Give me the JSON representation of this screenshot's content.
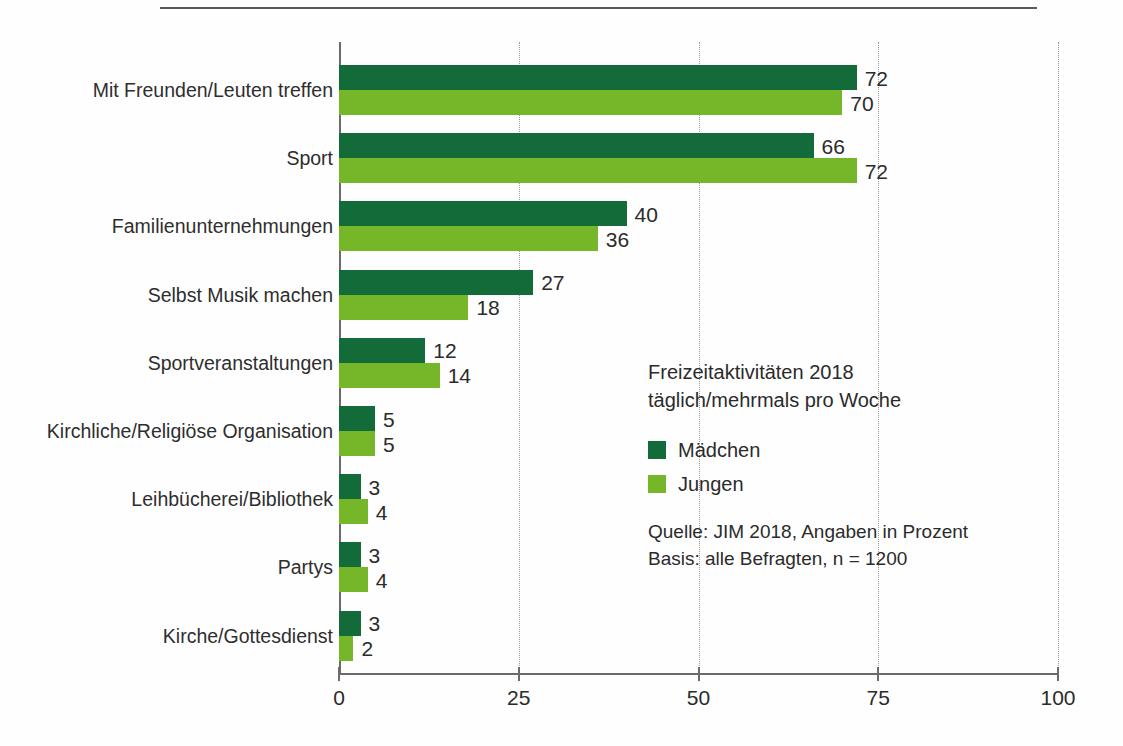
{
  "chart_data": {
    "type": "bar",
    "orientation": "horizontal",
    "title": "Freizeitaktivitäten 2018",
    "subtitle": "täglich/mehrmals pro Woche",
    "xlabel": "",
    "ylabel": "",
    "xlim": [
      0,
      100
    ],
    "xticks": [
      "0",
      "25",
      "50",
      "75",
      "100"
    ],
    "grid": "vertical-dotted",
    "legend_position": "inside-right",
    "categories": [
      "Mit Freunden/Leuten treffen",
      "Sport",
      "Familienunternehmungen",
      "Selbst Musik machen",
      "Sportveranstaltungen",
      "Kirchliche/Religiöse Organisation",
      "Leihbücherei/Bibliothek",
      "Partys",
      "Kirche/Gottesdienst"
    ],
    "series": [
      {
        "name": "Mädchen",
        "color": "#146b3a",
        "values": [
          72,
          66,
          40,
          27,
          12,
          5,
          3,
          3,
          3
        ]
      },
      {
        "name": "Jungen",
        "color": "#76b72a",
        "values": [
          70,
          72,
          36,
          18,
          14,
          5,
          4,
          4,
          2
        ]
      }
    ],
    "source": "Quelle: JIM 2018, Angaben in Prozent",
    "basis": "Basis: alle Befragten, n = 1200"
  },
  "legend": {
    "title_line1": "Freizeitaktivitäten 2018",
    "title_line2": "täglich/mehrmals pro Woche",
    "entries": [
      {
        "label": "Mädchen",
        "color": "#146b3a"
      },
      {
        "label": "Jungen",
        "color": "#76b72a"
      }
    ],
    "source_line1": "Quelle: JIM 2018, Angaben in Prozent",
    "source_line2": "Basis: alle Befragten, n = 1200"
  },
  "colors": {
    "girls": "#146b3a",
    "boys": "#76b72a",
    "axis": "#6b6b6b",
    "text": "#2b2b2b"
  }
}
